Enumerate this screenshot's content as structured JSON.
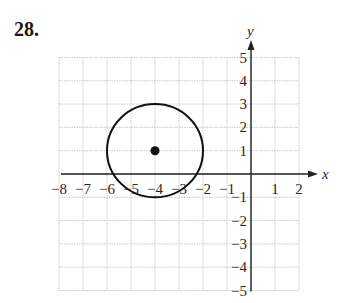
{
  "problem": {
    "number": "28."
  },
  "chart_data": {
    "type": "scatter",
    "title": "",
    "xlabel": "x",
    "ylabel": "y",
    "xlim": [
      -8,
      2
    ],
    "ylim": [
      -5,
      5
    ],
    "grid": true,
    "x_ticks": [
      "-8",
      "-7",
      "-6",
      "-5",
      "-4",
      "-3",
      "-2",
      "-1",
      "1",
      "2"
    ],
    "y_ticks": [
      "5",
      "4",
      "3",
      "2",
      "1",
      "-1",
      "-2",
      "-3",
      "-4",
      "-5"
    ],
    "shapes": [
      {
        "kind": "circle",
        "center": [
          -4,
          1
        ],
        "radius": 2
      }
    ],
    "points": [
      {
        "x": -4,
        "y": 1,
        "label": "center"
      }
    ]
  },
  "colors": {
    "grid": "#bbbbbb",
    "axis": "#222222",
    "curve": "#111111"
  }
}
